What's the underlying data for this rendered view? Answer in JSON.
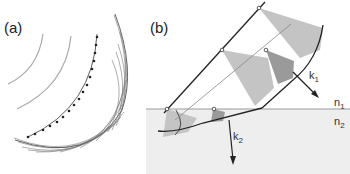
{
  "panels": {
    "a": {
      "label": "(a)"
    },
    "b": {
      "label": "(b)"
    }
  },
  "labels": {
    "k1": "k",
    "k1_sub": "1",
    "k2": "k",
    "k2_sub": "2",
    "n1": "n",
    "n1_sub": "1",
    "n2": "n",
    "n2_sub": "2"
  },
  "colors": {
    "lower_medium": "#eeeeee",
    "interface": "#999999",
    "cone_light": "#c4c4c4",
    "cone_dark": "#9a9a9a",
    "line_dark": "#222222",
    "line_gray": "#9a9a9a"
  }
}
